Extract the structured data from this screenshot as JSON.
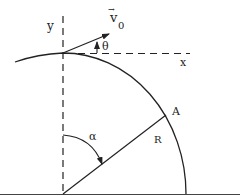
{
  "diagram": {
    "labels": {
      "velocity": "v",
      "velocity_subscript": "0",
      "velocity_arrow": "→",
      "theta": "θ",
      "x_axis": "x",
      "y_axis": "y",
      "point": "A",
      "radius": "R",
      "alpha": "α"
    },
    "colors": {
      "stroke": "#222222",
      "background": "#ffffff"
    }
  }
}
